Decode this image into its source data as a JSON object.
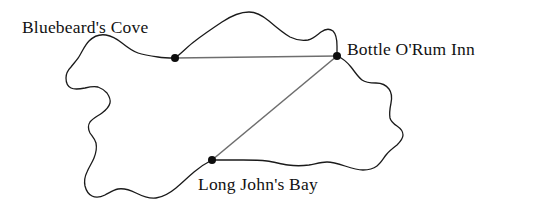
{
  "figure": {
    "name": "treasure-island-survey-map",
    "width": 538,
    "height": 219,
    "background_color": "#ffffff"
  },
  "coastline": {
    "name": "island-outline",
    "stroke_color": "#1a1a1a",
    "stroke_width": 1.3,
    "fill": "none"
  },
  "survey_lines": {
    "stroke_color": "#6e6e6e",
    "stroke_width": 1.6,
    "segments": [
      {
        "name": "cove-to-inn",
        "from": "Bluebeard's Cove",
        "to": "Bottle O'Rum Inn",
        "x1": 175,
        "y1": 58,
        "x2": 337,
        "y2": 56
      },
      {
        "name": "inn-to-bay",
        "from": "Bottle O'Rum Inn",
        "to": "Long John's Bay",
        "x1": 337,
        "y1": 56,
        "x2": 212,
        "y2": 160
      }
    ]
  },
  "landmarks": [
    {
      "id": "bluebeards-cove",
      "label": "Bluebeard's Cove",
      "x": 175,
      "y": 58,
      "marker_radius": 4,
      "marker_color": "#0d0d0d",
      "label_x": 22,
      "label_y": 19
    },
    {
      "id": "bottle-orum-inn",
      "label": "Bottle O'Rum Inn",
      "x": 337,
      "y": 56,
      "marker_radius": 4,
      "marker_color": "#0d0d0d",
      "label_x": 347,
      "label_y": 41
    },
    {
      "id": "long-johns-bay",
      "label": "Long John's Bay",
      "x": 212,
      "y": 160,
      "marker_radius": 4,
      "marker_color": "#0d0d0d",
      "label_x": 198,
      "label_y": 176
    }
  ]
}
